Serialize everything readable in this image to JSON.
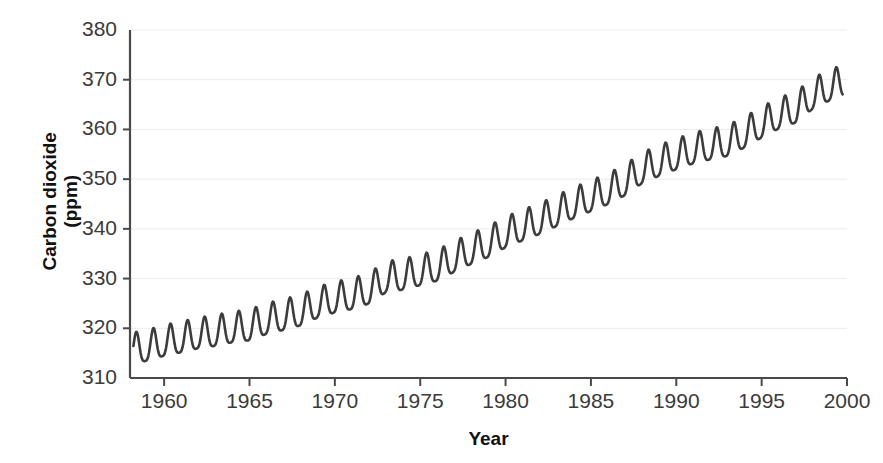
{
  "chart_data": {
    "type": "line",
    "title": "",
    "xlabel": "Year",
    "ylabel": "Carbon dioxide (ppm)",
    "ylabel_lines": [
      "Carbon dioxide",
      "(ppm)"
    ],
    "xlim": [
      1958,
      2000
    ],
    "ylim": [
      310,
      380
    ],
    "xticks": [
      1960,
      1965,
      1970,
      1975,
      1980,
      1985,
      1990,
      1995,
      2000
    ],
    "xtick_labels": [
      "1960",
      "1965",
      "1970",
      "1975",
      "1980",
      "1985",
      "1990",
      "1995",
      "2000"
    ],
    "yticks": [
      310,
      320,
      330,
      340,
      350,
      360,
      370,
      380
    ],
    "ytick_labels": [
      "310",
      "320",
      "330",
      "340",
      "350",
      "360",
      "370",
      "380"
    ],
    "grid": true,
    "grid_axis": "y",
    "grid_color": "#ebebeb",
    "line_color": "#3c3c3c",
    "line_width": 2.6,
    "legend": null,
    "series": [
      {
        "name": "Atmospheric CO2 (Mauna Loa)",
        "annual_mean_trend": [
          {
            "year": 1958,
            "value": 315.3
          },
          {
            "year": 1959,
            "value": 315.9
          },
          {
            "year": 1960,
            "value": 316.9
          },
          {
            "year": 1961,
            "value": 317.6
          },
          {
            "year": 1962,
            "value": 318.4
          },
          {
            "year": 1963,
            "value": 318.9
          },
          {
            "year": 1964,
            "value": 319.6
          },
          {
            "year": 1965,
            "value": 320.0
          },
          {
            "year": 1966,
            "value": 321.3
          },
          {
            "year": 1967,
            "value": 322.1
          },
          {
            "year": 1968,
            "value": 323.0
          },
          {
            "year": 1969,
            "value": 324.6
          },
          {
            "year": 1970,
            "value": 325.6
          },
          {
            "year": 1971,
            "value": 326.3
          },
          {
            "year": 1972,
            "value": 327.4
          },
          {
            "year": 1973,
            "value": 329.7
          },
          {
            "year": 1974,
            "value": 330.2
          },
          {
            "year": 1975,
            "value": 331.1
          },
          {
            "year": 1976,
            "value": 332.0
          },
          {
            "year": 1977,
            "value": 333.8
          },
          {
            "year": 1978,
            "value": 335.4
          },
          {
            "year": 1979,
            "value": 336.8
          },
          {
            "year": 1980,
            "value": 338.7
          },
          {
            "year": 1981,
            "value": 340.1
          },
          {
            "year": 1982,
            "value": 341.4
          },
          {
            "year": 1983,
            "value": 343.0
          },
          {
            "year": 1984,
            "value": 344.6
          },
          {
            "year": 1985,
            "value": 346.0
          },
          {
            "year": 1986,
            "value": 347.4
          },
          {
            "year": 1987,
            "value": 349.2
          },
          {
            "year": 1988,
            "value": 351.6
          },
          {
            "year": 1989,
            "value": 353.1
          },
          {
            "year": 1990,
            "value": 354.4
          },
          {
            "year": 1991,
            "value": 355.6
          },
          {
            "year": 1992,
            "value": 356.4
          },
          {
            "year": 1993,
            "value": 357.1
          },
          {
            "year": 1994,
            "value": 358.8
          },
          {
            "year": 1995,
            "value": 360.8
          },
          {
            "year": 1996,
            "value": 362.6
          },
          {
            "year": 1997,
            "value": 363.8
          },
          {
            "year": 1998,
            "value": 366.6
          },
          {
            "year": 1999,
            "value": 368.3
          },
          {
            "year": 2000,
            "value": 369.5
          }
        ],
        "seasonal_amplitude_ppm": 3.1,
        "seasonal_peak_month": 5,
        "description": "Monthly mean atmospheric carbon dioxide concentration showing a rising trend with an annual seasonal oscillation."
      }
    ],
    "value_range_note": {
      "first_observed": 316,
      "last_observed": 368,
      "max_peak": 371.5,
      "min_trough": 313.2
    }
  },
  "axes": {
    "x_title": "Year",
    "y_title_line1": "Carbon dioxide",
    "y_title_line2": "(ppm)"
  }
}
